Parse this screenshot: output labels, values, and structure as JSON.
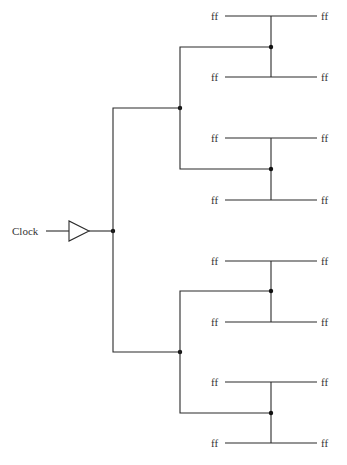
{
  "diagram": {
    "input_label": "Clock",
    "buffer_icon": "buffer-triangle-icon",
    "leaf_label": "ff",
    "groups": [
      {
        "top_left": "ff",
        "top_right": "ff",
        "bottom_left": "ff",
        "bottom_right": "ff"
      },
      {
        "top_left": "ff",
        "top_right": "ff",
        "bottom_left": "ff",
        "bottom_right": "ff"
      },
      {
        "top_left": "ff",
        "top_right": "ff",
        "bottom_left": "ff",
        "bottom_right": "ff"
      },
      {
        "top_left": "ff",
        "top_right": "ff",
        "bottom_left": "ff",
        "bottom_right": "ff"
      }
    ],
    "colors": {
      "wire": "#2a2a2a",
      "text": "#333333",
      "background": "#ffffff"
    }
  }
}
